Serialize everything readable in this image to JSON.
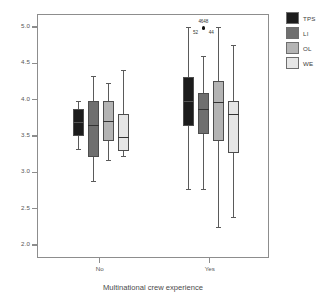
{
  "chart_data": {
    "type": "box",
    "title": "",
    "xlabel": "Multinational crew experience",
    "ylabel": "",
    "categories": [
      "No",
      "Yes"
    ],
    "ylim": [
      2.0,
      5.0
    ],
    "yticks": [
      "2.0",
      "2.5",
      "3.0",
      "3.5",
      "4.0",
      "4.5",
      "5.0"
    ],
    "ytick_values": [
      2.0,
      2.5,
      3.0,
      3.5,
      4.0,
      4.5,
      5.0
    ],
    "grid": false,
    "legend_position": "right",
    "series": [
      {
        "name": "TPS",
        "color": "#1c1c1c",
        "boxes": [
          {
            "category": "No",
            "whisker_low": 3.33,
            "q1": 3.52,
            "median": 3.71,
            "q3": 3.89,
            "whisker_high": 3.99
          },
          {
            "category": "Yes",
            "whisker_low": 2.78,
            "q1": 3.65,
            "median": 4.0,
            "q3": 4.32,
            "whisker_high": 5.02
          }
        ]
      },
      {
        "name": "LI",
        "color": "#6f6f6f",
        "boxes": [
          {
            "category": "No",
            "whisker_low": 2.89,
            "q1": 3.22,
            "median": 3.66,
            "q3": 3.99,
            "whisker_high": 4.34
          },
          {
            "category": "Yes",
            "whisker_low": 2.78,
            "q1": 3.54,
            "median": 3.88,
            "q3": 4.1,
            "whisker_high": 4.62,
            "outliers": [
              {
                "value": 5.0,
                "labels": [
                  "4648",
                  "52",
                  "44"
                ]
              }
            ]
          }
        ]
      },
      {
        "name": "OL",
        "color": "#b4b4b4",
        "boxes": [
          {
            "category": "No",
            "whisker_low": 3.18,
            "q1": 3.45,
            "median": 3.72,
            "q3": 3.99,
            "whisker_high": 4.25
          },
          {
            "category": "Yes",
            "whisker_low": 2.26,
            "q1": 3.44,
            "median": 3.98,
            "q3": 4.27,
            "whisker_high": 5.02
          }
        ]
      },
      {
        "name": "WE",
        "color": "#e6e6e6",
        "boxes": [
          {
            "category": "No",
            "whisker_low": 3.24,
            "q1": 3.31,
            "median": 3.5,
            "q3": 3.82,
            "whisker_high": 4.42
          },
          {
            "category": "Yes",
            "whisker_low": 2.4,
            "q1": 3.28,
            "median": 3.81,
            "q3": 3.99,
            "whisker_high": 4.77
          }
        ]
      }
    ]
  },
  "legend": {
    "items": [
      {
        "label": "TPS",
        "color": "#1c1c1c"
      },
      {
        "label": "LI",
        "color": "#6f6f6f"
      },
      {
        "label": "OL",
        "color": "#b4b4b4"
      },
      {
        "label": "WE",
        "color": "#e6e6e6"
      }
    ]
  },
  "axis": {
    "x_title": "Multinational crew experience",
    "x_categories": [
      "No",
      "Yes"
    ],
    "y_ticks": [
      "5.0",
      "4.5",
      "4.0",
      "3.5",
      "3.0",
      "2.5",
      "2.0"
    ]
  }
}
